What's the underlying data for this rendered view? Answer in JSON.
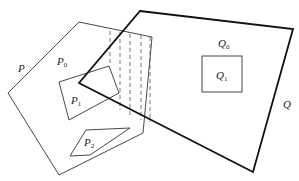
{
  "diagram": {
    "labels": {
      "P": "P",
      "P0_main": "P",
      "P0_sub": "0",
      "P1_main": "P",
      "P1_sub": "1",
      "P2_main": "P",
      "P2_sub": "2",
      "Q": "Q",
      "Q0_main": "Q",
      "Q0_sub": "0",
      "Q1_main": "Q",
      "Q1_sub": "1"
    },
    "shapes": {
      "P": {
        "type": "polygon",
        "stroke": "#333333",
        "points": [
          [
            79,
            22
          ],
          [
            8,
            93
          ],
          [
            59,
            175
          ],
          [
            143,
            133
          ],
          [
            152,
            37
          ]
        ]
      },
      "P1": {
        "type": "polygon",
        "stroke": "#333333",
        "points": [
          [
            59,
            82
          ],
          [
            109,
            66
          ],
          [
            119,
            93
          ],
          [
            69,
            120
          ]
        ]
      },
      "P2": {
        "type": "polygon",
        "stroke": "#333333",
        "points": [
          [
            86,
            130
          ],
          [
            130,
            128
          ],
          [
            90,
            155
          ],
          [
            70,
            156
          ]
        ]
      },
      "Q": {
        "type": "polygon",
        "stroke": "#111111",
        "points": [
          [
            140,
            11
          ],
          [
            293,
            29
          ],
          [
            253,
            172
          ],
          [
            79,
            83
          ]
        ]
      },
      "Q1": {
        "type": "rect",
        "stroke": "#333333",
        "x": 202,
        "y": 56,
        "w": 40,
        "h": 36
      },
      "hatch": {
        "type": "dashed-lines",
        "stroke": "#555555",
        "x": [
          110,
          120,
          130,
          141,
          150
        ]
      }
    }
  }
}
